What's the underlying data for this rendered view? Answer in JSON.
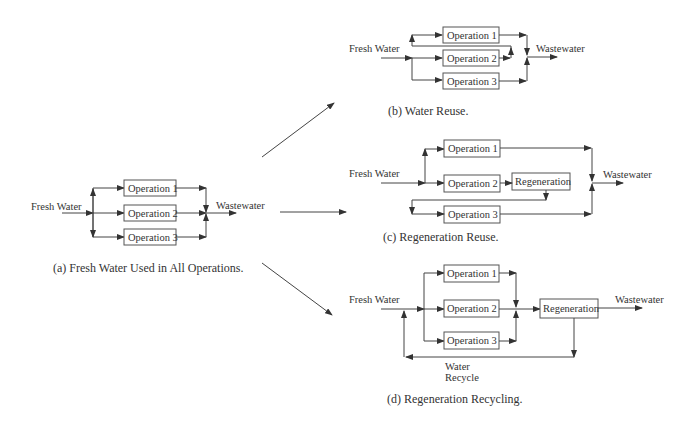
{
  "diagram": {
    "panels": {
      "a": {
        "caption": "(a) Fresh Water Used in All Operations.",
        "inlet": "Fresh Water",
        "outlet": "Wastewater",
        "operations": [
          "Operation 1",
          "Operation 2",
          "Operation 3"
        ]
      },
      "b": {
        "caption": "(b) Water Reuse.",
        "inlet": "Fresh Water",
        "outlet": "Wastewater",
        "operations": [
          "Operation 1",
          "Operation 2",
          "Operation 3"
        ]
      },
      "c": {
        "caption": "(c) Regeneration Reuse.",
        "inlet": "Fresh Water",
        "outlet": "Wastewater",
        "operations": [
          "Operation 1",
          "Operation 2",
          "Operation 3"
        ],
        "regeneration": "Regeneration"
      },
      "d": {
        "caption": "(d) Regeneration Recycling.",
        "inlet": "Fresh Water",
        "outlet": "Wastewater",
        "operations": [
          "Operation 1",
          "Operation 2",
          "Operation 3"
        ],
        "regeneration": "Regeneration",
        "recycle_label_line1": "Water",
        "recycle_label_line2": "Recycle"
      }
    }
  }
}
